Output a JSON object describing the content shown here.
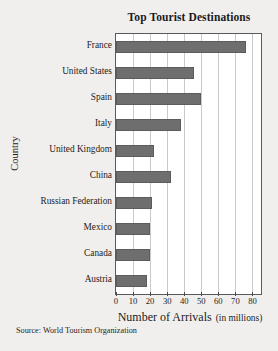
{
  "chart_data": {
    "type": "bar",
    "orientation": "horizontal",
    "title": "Top Tourist Destinations",
    "xlabel": "Number of Arrivals",
    "xlabel_sub": "(in millions)",
    "ylabel": "Country",
    "categories": [
      "France",
      "United States",
      "Spain",
      "Italy",
      "United Kingdom",
      "China",
      "Russian Federation",
      "Mexico",
      "Canada",
      "Austria"
    ],
    "values": [
      76,
      46,
      50,
      38,
      22,
      32,
      21,
      20,
      20,
      18
    ],
    "xlim": [
      0,
      85
    ],
    "xticks": [
      0,
      10,
      20,
      30,
      40,
      50,
      60,
      70,
      80
    ],
    "xtick_labels": [
      "0",
      "10",
      "20",
      "30",
      "40",
      "50",
      "60",
      "70",
      "80"
    ],
    "grid": true,
    "grid_axis": "x",
    "legend": false,
    "bar_color": "#6e6e6e",
    "plot_background": "#ffffff",
    "figure_background": "#f1efed",
    "axis_color": "#5a5a5a",
    "grid_color": "#c9c9c9"
  },
  "source_note": "Source: World Tourism Organization"
}
